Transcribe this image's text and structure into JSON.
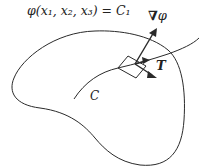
{
  "diagram": {
    "surface_label": "φ(x₁, x₂, x₃) = C₁",
    "gradient_label": "∇",
    "gradient_symbol": "φ",
    "tangent_label": "T",
    "curve_label": "C",
    "stroke_color": "#2a2a2a"
  }
}
